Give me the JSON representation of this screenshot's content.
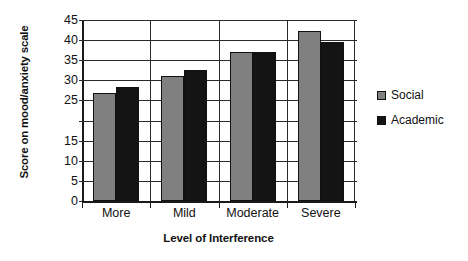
{
  "chart_data": {
    "type": "bar",
    "title": "",
    "xlabel": "Level of Interference",
    "ylabel": "Score on mood/anxiety scale",
    "categories": [
      "More",
      "Mild",
      "Moderate",
      "Severe"
    ],
    "series": [
      {
        "name": "Social",
        "color": "#808080",
        "values": [
          26.8,
          31.2,
          37.0,
          42.2
        ]
      },
      {
        "name": "Academic",
        "color": "#141414",
        "values": [
          28.3,
          32.5,
          37.0,
          39.6
        ]
      }
    ],
    "ylim": [
      0,
      45
    ],
    "ytick_labels": [
      "45",
      "40",
      "35",
      "30",
      "25",
      "15",
      "10",
      "5",
      "0"
    ],
    "ytick_values": [
      45,
      40,
      35,
      30,
      25,
      20,
      15,
      10,
      5,
      0
    ],
    "grid": true,
    "legend_position": "right",
    "legend": [
      {
        "label": "Social",
        "color": "#808080"
      },
      {
        "label": "Academic",
        "color": "#141414"
      }
    ]
  }
}
